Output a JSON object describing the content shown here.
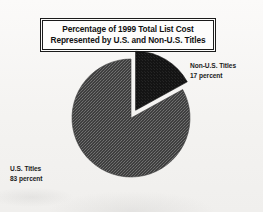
{
  "figure": {
    "background_color": "#f5f4f2",
    "title": {
      "line1": "Percentage of 1999 Total List Cost",
      "line2": "Represented by U.S. and Non-U.S. Titles"
    }
  },
  "labels": {
    "non_us": {
      "name": "Non-U.S. Titles",
      "value": "17 percent"
    },
    "us": {
      "name": "U.S. Titles",
      "value": "83 percent"
    }
  },
  "chart_data": {
    "type": "pie",
    "title": "Percentage of 1999 Total List Cost Represented by U.S. and Non-U.S. Titles",
    "xlabel": "",
    "ylabel": "",
    "legend_position": "none",
    "grid": false,
    "units": "percent",
    "total": 100,
    "start_angle_deg": 0,
    "direction": "clockwise",
    "categories": [
      "Non-U.S. Titles",
      "U.S. Titles"
    ],
    "values": [
      17,
      83
    ],
    "slices": [
      {
        "label": "Non-U.S. Titles",
        "value": 17,
        "display_value": "17 percent",
        "color": "#1a1a1a",
        "exploded": true,
        "start_angle_deg": 0,
        "end_angle_deg": 61.2
      },
      {
        "label": "U.S. Titles",
        "value": 83,
        "display_value": "83 percent",
        "color": "#4a4a4a",
        "exploded": false,
        "start_angle_deg": 61.2,
        "end_angle_deg": 360
      }
    ]
  }
}
